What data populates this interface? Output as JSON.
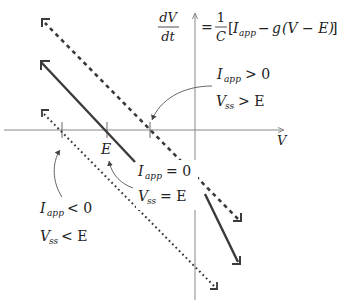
{
  "diagram": {
    "type": "phase-line plot",
    "equation": {
      "lhs_num": "dV",
      "lhs_den": "dt",
      "eq": "=",
      "frac_num": "1",
      "frac_den": "C",
      "rhs_open": "[",
      "I": "I",
      "I_sub": "app",
      "minus": "−",
      "g": "g",
      "paren": "(V − E)",
      "rhs_close": "]"
    },
    "axes": {
      "x_label": "V",
      "tick_label_E": "E"
    },
    "annotations": {
      "positive": {
        "line1_I": "I",
        "line1_sub": "app",
        "line1_rel": "> 0",
        "line2_V": "V",
        "line2_sub": "ss",
        "line2_rel": "> E"
      },
      "zero": {
        "line1_I": "I",
        "line1_sub": "app",
        "line1_rel": "= 0",
        "line2_V": "V",
        "line2_sub": "ss",
        "line2_rel": "= E"
      },
      "negative": {
        "line1_I": "I",
        "line1_sub": "app",
        "line1_rel": "< 0",
        "line2_V": "V",
        "line2_sub": "ss",
        "line2_rel": "< E"
      }
    },
    "lines": [
      {
        "name": "I_app > 0",
        "style": "dashed"
      },
      {
        "name": "I_app = 0",
        "style": "solid"
      },
      {
        "name": "I_app < 0",
        "style": "dotted"
      }
    ],
    "colors": {
      "line": "#3a3a3a",
      "axis": "#888888",
      "text": "#222222"
    }
  }
}
